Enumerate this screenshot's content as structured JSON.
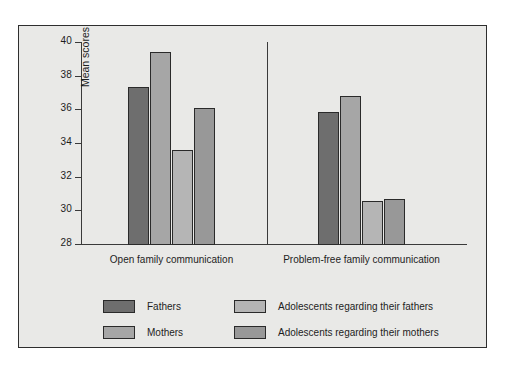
{
  "chart_data": {
    "type": "bar",
    "title": "",
    "subtitle": "",
    "xlabel": "",
    "ylabel": "Mean scores",
    "ylim": [
      28,
      40
    ],
    "yticks": [
      28,
      30,
      32,
      34,
      36,
      38,
      40
    ],
    "ytick_labels": [
      "28",
      "30",
      "32",
      "34",
      "36",
      "38",
      "40"
    ],
    "grid": false,
    "legend_position": "bottom",
    "categories": [
      "Open family communication",
      "Problem-free family communication"
    ],
    "series": [
      {
        "name": "Fathers",
        "color": "#6e6e6e",
        "values": [
          37.3,
          35.85
        ]
      },
      {
        "name": "Mothers",
        "color": "#a6a6a6",
        "values": [
          39.4,
          36.8
        ]
      },
      {
        "name": "Adolescents regarding their fathers",
        "color": "#b5b5b5",
        "values": [
          33.6,
          30.55
        ]
      },
      {
        "name": "Adolescents regarding their mothers",
        "color": "#989898",
        "values": [
          36.1,
          30.7
        ]
      }
    ],
    "annotations": []
  },
  "legend": {
    "items": [
      {
        "label": "Fathers",
        "color": "#6e6e6e"
      },
      {
        "label": "Mothers",
        "color": "#a6a6a6"
      },
      {
        "label": "Adolescents regarding their fathers",
        "color": "#b5b5b5"
      },
      {
        "label": "Adolescents regarding their mothers",
        "color": "#989898"
      }
    ]
  },
  "figure": {
    "background_color": "#e9e9e7",
    "border_color": "#2e2e2e",
    "axis_color": "#3a3a3a",
    "text_color": "#1d1d1d"
  }
}
